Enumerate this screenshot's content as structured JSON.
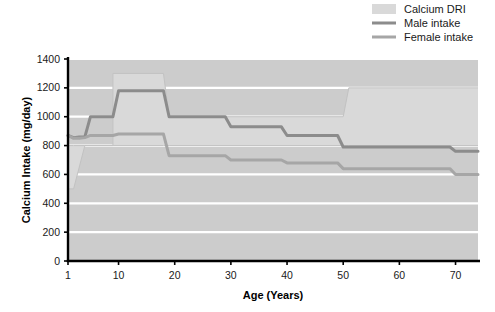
{
  "chart_data": {
    "type": "line",
    "title": "",
    "xlabel": "Age (Years)",
    "ylabel": "Calcium Intake (mg/day)",
    "xlim": [
      1,
      74
    ],
    "ylim": [
      0,
      1400
    ],
    "xticks": [
      1,
      10,
      20,
      30,
      40,
      50,
      60,
      70
    ],
    "yticks": [
      0,
      200,
      400,
      600,
      800,
      1000,
      1200,
      1400
    ],
    "grid": true,
    "grid_axis": "y",
    "legend_position": "top-right",
    "plot_background": "#cccccc",
    "series": [
      {
        "name": "Calcium DRI",
        "kind": "band",
        "color": "#d9d9d9",
        "x": [
          1,
          2,
          4,
          9,
          9,
          18,
          19,
          50,
          51,
          74
        ],
        "upper": [
          800,
          800,
          800,
          800,
          1300,
          1300,
          1000,
          1000,
          1200,
          1200
        ],
        "lower": [
          500,
          500,
          800,
          800,
          800,
          800,
          800,
          800,
          800,
          800
        ]
      },
      {
        "name": "Male intake",
        "kind": "line",
        "color": "#8c8c8c",
        "x": [
          1,
          2,
          3,
          4,
          5,
          9,
          10,
          12,
          18,
          19,
          29,
          30,
          39,
          40,
          49,
          50,
          59,
          60,
          69,
          70,
          74
        ],
        "y": [
          870,
          855,
          860,
          860,
          1000,
          1000,
          1180,
          1180,
          1180,
          1000,
          1000,
          930,
          930,
          870,
          870,
          790,
          790,
          790,
          790,
          760,
          760
        ]
      },
      {
        "name": "Female intake",
        "kind": "line",
        "color": "#a6a6a6",
        "x": [
          1,
          2,
          3,
          4,
          5,
          9,
          10,
          12,
          18,
          19,
          29,
          30,
          39,
          40,
          49,
          50,
          59,
          60,
          69,
          70,
          74
        ],
        "y": [
          870,
          850,
          850,
          855,
          870,
          870,
          880,
          880,
          880,
          730,
          730,
          700,
          700,
          680,
          680,
          640,
          640,
          640,
          640,
          600,
          600
        ]
      }
    ]
  },
  "legend": {
    "items": [
      {
        "label": "Calcium DRI",
        "marker": "swatch",
        "color": "#d9d9d9"
      },
      {
        "label": "Male intake",
        "marker": "line",
        "color": "#8c8c8c"
      },
      {
        "label": "Female intake",
        "marker": "line",
        "color": "#a6a6a6"
      }
    ]
  }
}
